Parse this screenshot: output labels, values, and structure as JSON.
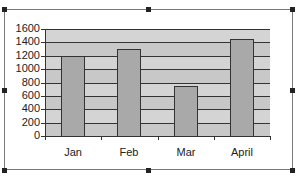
{
  "chart_data": {
    "type": "bar",
    "title": "",
    "xlabel": "",
    "ylabel": "",
    "categories": [
      "Jan",
      "Feb",
      "Mar",
      "April"
    ],
    "values": [
      1200,
      1300,
      750,
      1450
    ],
    "ylim": [
      0,
      1600
    ],
    "yticks": [
      0,
      200,
      400,
      600,
      800,
      1000,
      1200,
      1400,
      1600
    ],
    "ytick_labels": [
      "0",
      "200",
      "400",
      "600",
      "800",
      "1000",
      "1200",
      "1400",
      "1600"
    ],
    "grid": true,
    "legend": "none"
  },
  "colors": {
    "plot_background": "#c8c8c8",
    "bar_fill": "#a9a9a9",
    "gridline": "#333333",
    "frame_border": "#7a7a7a"
  }
}
